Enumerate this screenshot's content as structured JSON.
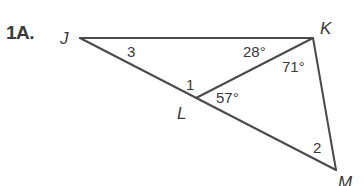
{
  "problem": {
    "number": "1A."
  },
  "vertices": {
    "J": {
      "label": "J",
      "x": 80,
      "y": 38
    },
    "K": {
      "label": "K",
      "x": 313,
      "y": 38
    },
    "L": {
      "label": "L",
      "x": 196,
      "y": 98
    },
    "M": {
      "label": "M",
      "x": 336,
      "y": 170
    }
  },
  "segments": [
    {
      "from": "J",
      "to": "K"
    },
    {
      "from": "J",
      "to": "M"
    },
    {
      "from": "K",
      "to": "M"
    },
    {
      "from": "K",
      "to": "L"
    }
  ],
  "angles": {
    "angle3": {
      "label": "3"
    },
    "angleJKL": {
      "label": "28°"
    },
    "angleLKM": {
      "label": "71°"
    },
    "angle1": {
      "label": "1"
    },
    "angleKLM": {
      "label": "57°"
    },
    "angle2": {
      "label": "2"
    }
  },
  "colors": {
    "line": "#4a4a4a",
    "text": "#3a3a3a",
    "background": "#ffffff"
  }
}
